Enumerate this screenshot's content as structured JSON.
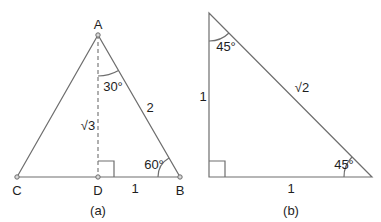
{
  "figure_a": {
    "caption": "(a)",
    "vertices": {
      "A": "A",
      "B": "B",
      "C": "C",
      "D": "D"
    },
    "sides": {
      "AB": "2",
      "AD": "√3",
      "DB": "1"
    },
    "angles": {
      "at_A": "30°",
      "at_B": "60°"
    },
    "right_angle_at": "D"
  },
  "figure_b": {
    "caption": "(b)",
    "sides": {
      "vertical_leg": "1",
      "horizontal_leg": "1",
      "hypotenuse": "√2"
    },
    "angles": {
      "top": "45°",
      "bottom_right": "45°"
    },
    "right_angle_at": "bottom-left"
  }
}
